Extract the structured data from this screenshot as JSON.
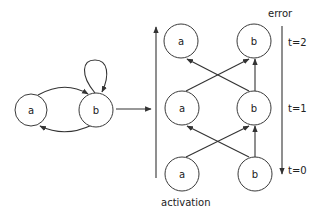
{
  "diagram": {
    "recurrent": {
      "nodes": [
        {
          "id": "a",
          "label": "a"
        },
        {
          "id": "b",
          "label": "b"
        }
      ],
      "edges": [
        {
          "from": "a",
          "to": "b"
        },
        {
          "from": "b",
          "to": "a"
        },
        {
          "from": "b",
          "to": "b"
        }
      ]
    },
    "unrolled": {
      "rows": [
        {
          "time_label": "t=2",
          "nodes": [
            "a",
            "b"
          ]
        },
        {
          "time_label": "t=1",
          "nodes": [
            "a",
            "b"
          ]
        },
        {
          "time_label": "t=0",
          "nodes": [
            "a",
            "b"
          ]
        }
      ],
      "edges_between_rows": [
        {
          "from": "a",
          "to": "b"
        },
        {
          "from": "b",
          "to": "a"
        },
        {
          "from": "b",
          "to": "b"
        }
      ]
    },
    "labels": {
      "error": "error",
      "activation": "activation",
      "t2": "t=2",
      "t1": "t=1",
      "t0": "t=0"
    },
    "node_labels": {
      "a": "a",
      "b": "b"
    }
  }
}
